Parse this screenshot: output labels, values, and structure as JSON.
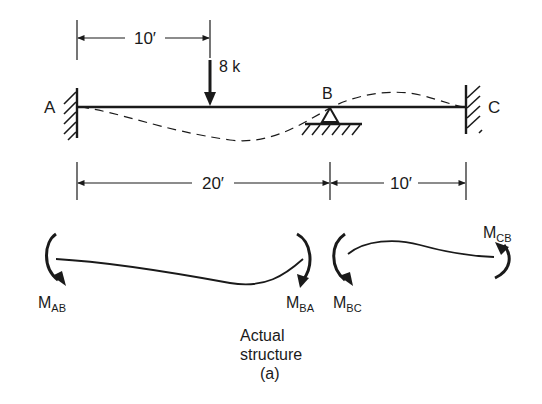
{
  "diagram": {
    "type": "continuous-beam-free-body",
    "supports": [
      {
        "label": "A",
        "kind": "fixed"
      },
      {
        "label": "B",
        "kind": "pin"
      },
      {
        "label": "C",
        "kind": "fixed"
      }
    ],
    "load": {
      "label": "8 k",
      "kind": "point-load"
    },
    "dimensions": {
      "top": "10′",
      "span_ab": "20′",
      "span_bc": "10′"
    },
    "moments": {
      "m_ab": {
        "base": "M",
        "sub": "AB"
      },
      "m_ba": {
        "base": "M",
        "sub": "BA"
      },
      "m_bc": {
        "base": "M",
        "sub": "BC"
      },
      "m_cb": {
        "base": "M",
        "sub": "CB"
      }
    },
    "caption": {
      "line1": "Actual",
      "line2": "structure",
      "line3": "(a)"
    },
    "colors": {
      "ink": "#1a1a1a",
      "background": "#ffffff"
    }
  }
}
